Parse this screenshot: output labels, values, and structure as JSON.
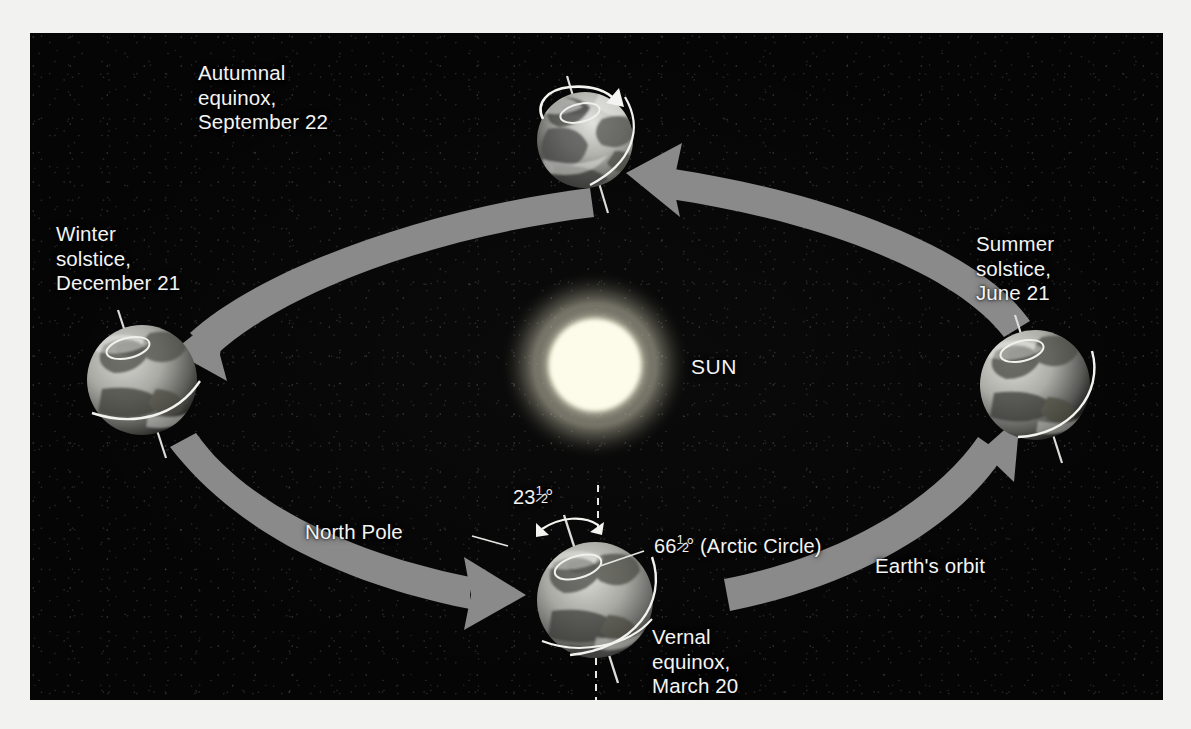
{
  "diagram": {
    "background_color": "#050505",
    "page_color": "#f2f2f0",
    "orbit_band_color": "#8a8a8a",
    "label_color": "#f4f4f4",
    "sun_color": "#fdfbe8"
  },
  "sun": {
    "label": "SUN",
    "center_x": 565,
    "center_y": 332,
    "radius": 52
  },
  "positions": [
    {
      "id": "autumnal-equinox",
      "label_lines": [
        "Autumnal",
        "equinox,",
        "September 22"
      ],
      "label": "Autumnal equinox, September 22",
      "date": "September 22",
      "center_x": 555,
      "center_y": 107,
      "radius": 48,
      "has_rotation_arrow": true
    },
    {
      "id": "winter-solstice",
      "label_lines": [
        "Winter",
        "solstice,",
        "December 21"
      ],
      "label": "Winter solstice, December 21",
      "date": "December 21",
      "center_x": 112,
      "center_y": 347,
      "radius": 55,
      "has_rotation_arrow": false
    },
    {
      "id": "summer-solstice",
      "label_lines": [
        "Summer",
        "solstice,",
        "June 21"
      ],
      "label": "Summer solstice, June 21",
      "date": "June 21",
      "center_x": 1005,
      "center_y": 352,
      "radius": 55,
      "has_rotation_arrow": false
    },
    {
      "id": "vernal-equinox",
      "label_lines": [
        "Vernal",
        "equinox,",
        "March 20"
      ],
      "label": "Vernal equinox, March 20",
      "date": "March 20",
      "center_x": 565,
      "center_y": 567,
      "radius": 58,
      "has_rotation_arrow": false
    }
  ],
  "annotations": {
    "orbit": "Earth's orbit",
    "north_pole": "North Pole",
    "axial_tilt_value": "23",
    "axial_tilt_degree": "°",
    "arctic_circle_value": "66",
    "arctic_circle_degree": "°",
    "arctic_circle_name": "(Arctic Circle)",
    "fraction_numerator": "1",
    "fraction_denominator": "2"
  }
}
